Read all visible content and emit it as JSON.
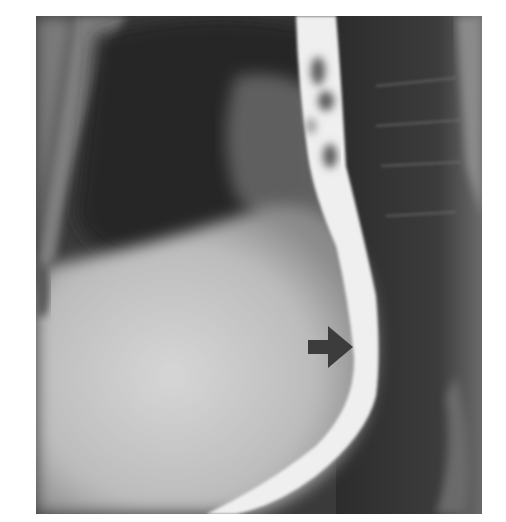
{
  "image": {
    "subject": "barium esophagram radiograph",
    "tone": "grayscale",
    "annotations": [
      {
        "type": "arrow",
        "direction": "right",
        "color": "#3c3c3c"
      }
    ],
    "colors": {
      "background": "#ffffff",
      "dark_lung": "#2f2f2f",
      "mid_tissue": "#6a6a6a",
      "heart_shadow": "#bdbdbd",
      "barium": "#efefef",
      "arrow": "#3c3c3c"
    }
  }
}
